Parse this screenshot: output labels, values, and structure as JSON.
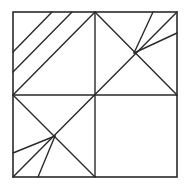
{
  "diagram": {
    "type": "square-tangram-dissection",
    "stroke_color": "#2a2a2a",
    "background": "#ffffff",
    "square": {
      "x1": 13,
      "y1": 12,
      "x2": 177,
      "y2": 177
    },
    "center": [
      95,
      95
    ],
    "lines": [
      {
        "id": "mid-vertical",
        "from": [
          95,
          12
        ],
        "to": [
          95,
          177
        ]
      },
      {
        "id": "mid-horizontal",
        "from": [
          13,
          95
        ],
        "to": [
          177,
          95
        ]
      },
      {
        "id": "diag-tr-bl",
        "from": [
          177,
          12
        ],
        "to": [
          13,
          177
        ]
      },
      {
        "id": "ur-quad-tl-br",
        "from": [
          95,
          12
        ],
        "to": [
          177,
          95
        ]
      },
      {
        "id": "ll-quad-tl-br",
        "from": [
          13,
          95
        ],
        "to": [
          95,
          177
        ]
      },
      {
        "id": "ul-stripe-1",
        "from": [
          52,
          12
        ],
        "to": [
          13,
          52
        ]
      },
      {
        "id": "ul-stripe-2",
        "from": [
          72,
          12
        ],
        "to": [
          13,
          72
        ]
      },
      {
        "id": "ul-stripe-3",
        "from": [
          95,
          12
        ],
        "to": [
          13,
          95
        ]
      },
      {
        "id": "ur-fan-top",
        "from": [
          134,
          53
        ],
        "to": [
          153,
          12
        ]
      },
      {
        "id": "ur-fan-right",
        "from": [
          134,
          53
        ],
        "to": [
          177,
          33
        ]
      },
      {
        "id": "ll-fan-left",
        "from": [
          55,
          136
        ],
        "to": [
          13,
          153
        ]
      },
      {
        "id": "ll-fan-bottom",
        "from": [
          55,
          136
        ],
        "to": [
          38,
          177
        ]
      }
    ]
  }
}
